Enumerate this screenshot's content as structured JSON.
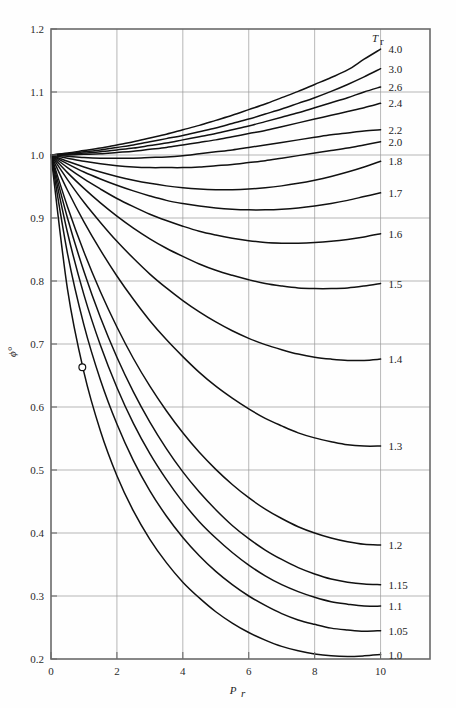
{
  "chart_data": {
    "type": "line",
    "title": "",
    "xlabel": "P_r",
    "ylabel": "ϕ°",
    "xlim": [
      0,
      11.5
    ],
    "ylim": [
      0.2,
      1.2
    ],
    "grid": true,
    "legend_position": "right-of-plot",
    "legend_title": "T_r",
    "x_ticks": [
      0,
      2,
      4,
      6,
      8,
      10
    ],
    "x_tick_labels": [
      "0",
      "2",
      "4",
      "6",
      "8",
      "10"
    ],
    "y_ticks": [
      0.2,
      0.3,
      0.4,
      0.5,
      0.6,
      0.7,
      0.8,
      0.9,
      1.0,
      1.1,
      1.2
    ],
    "y_tick_labels": [
      "0.2",
      "0.3",
      "0.4",
      "0.5",
      "0.6",
      "0.7",
      "0.8",
      "0.9",
      "1.0",
      "1.1",
      "1.2"
    ],
    "x_gridlines": [
      2,
      4,
      6,
      8,
      10
    ],
    "y_gridlines": [
      0.3,
      0.4,
      0.5,
      0.6,
      0.7,
      0.8,
      0.9,
      1.0,
      1.1
    ],
    "annotation_marker": {
      "x": 0.95,
      "y": 0.663,
      "shape": "open-circle"
    },
    "x": [
      0,
      0.5,
      1,
      1.5,
      2,
      2.5,
      3,
      3.5,
      4,
      4.5,
      5,
      5.5,
      6,
      6.5,
      7,
      7.5,
      8,
      8.5,
      9,
      9.5,
      10
    ],
    "series": [
      {
        "name": "4.0",
        "label": "4.0",
        "values": [
          1.0,
          1.003,
          1.007,
          1.011,
          1.016,
          1.021,
          1.027,
          1.033,
          1.04,
          1.047,
          1.055,
          1.063,
          1.072,
          1.081,
          1.091,
          1.101,
          1.112,
          1.123,
          1.135,
          1.152,
          1.168
        ]
      },
      {
        "name": "3.0",
        "label": "3.0",
        "values": [
          1.0,
          1.002,
          1.005,
          1.008,
          1.012,
          1.016,
          1.021,
          1.026,
          1.031,
          1.037,
          1.043,
          1.05,
          1.057,
          1.065,
          1.073,
          1.082,
          1.091,
          1.101,
          1.112,
          1.124,
          1.137
        ]
      },
      {
        "name": "2.6",
        "label": "2.6",
        "values": [
          1.0,
          1.001,
          1.003,
          1.005,
          1.008,
          1.011,
          1.015,
          1.019,
          1.024,
          1.029,
          1.034,
          1.04,
          1.046,
          1.053,
          1.06,
          1.067,
          1.075,
          1.083,
          1.091,
          1.1,
          1.108
        ]
      },
      {
        "name": "2.4",
        "label": "2.4",
        "values": [
          1.0,
          1.0,
          1.001,
          1.002,
          1.004,
          1.006,
          1.009,
          1.012,
          1.016,
          1.02,
          1.024,
          1.029,
          1.034,
          1.039,
          1.045,
          1.051,
          1.057,
          1.063,
          1.069,
          1.075,
          1.082
        ]
      },
      {
        "name": "2.2",
        "label": "2.2",
        "values": [
          1.0,
          0.998,
          0.996,
          0.995,
          0.995,
          0.995,
          0.996,
          0.997,
          0.999,
          1.002,
          1.005,
          1.008,
          1.012,
          1.016,
          1.02,
          1.024,
          1.028,
          1.032,
          1.035,
          1.038,
          1.04
        ]
      },
      {
        "name": "2.0",
        "label": "2.0",
        "values": [
          1.0,
          0.995,
          0.99,
          0.986,
          0.983,
          0.981,
          0.98,
          0.98,
          0.98,
          0.981,
          0.983,
          0.985,
          0.988,
          0.991,
          0.995,
          0.999,
          1.003,
          1.007,
          1.011,
          1.016,
          1.021
        ]
      },
      {
        "name": "1.8",
        "label": "1.8",
        "values": [
          1.0,
          0.99,
          0.981,
          0.973,
          0.966,
          0.96,
          0.955,
          0.951,
          0.948,
          0.946,
          0.945,
          0.945,
          0.946,
          0.948,
          0.951,
          0.955,
          0.96,
          0.966,
          0.973,
          0.981,
          0.99
        ]
      },
      {
        "name": "1.7",
        "label": "1.7",
        "values": [
          1.0,
          0.986,
          0.973,
          0.962,
          0.952,
          0.943,
          0.935,
          0.928,
          0.923,
          0.919,
          0.916,
          0.914,
          0.913,
          0.913,
          0.914,
          0.916,
          0.919,
          0.923,
          0.928,
          0.934,
          0.94
        ]
      },
      {
        "name": "1.6",
        "label": "1.6",
        "values": [
          1.0,
          0.98,
          0.962,
          0.946,
          0.931,
          0.918,
          0.906,
          0.896,
          0.887,
          0.879,
          0.873,
          0.868,
          0.864,
          0.861,
          0.86,
          0.86,
          0.861,
          0.863,
          0.866,
          0.87,
          0.875
        ]
      },
      {
        "name": "1.5",
        "label": "1.5",
        "values": [
          1.0,
          0.972,
          0.947,
          0.924,
          0.903,
          0.884,
          0.867,
          0.852,
          0.839,
          0.827,
          0.817,
          0.809,
          0.802,
          0.796,
          0.792,
          0.789,
          0.788,
          0.788,
          0.789,
          0.792,
          0.796
        ]
      },
      {
        "name": "1.4",
        "label": "1.4",
        "values": [
          1.0,
          0.961,
          0.925,
          0.893,
          0.863,
          0.836,
          0.811,
          0.789,
          0.769,
          0.751,
          0.735,
          0.721,
          0.709,
          0.699,
          0.691,
          0.684,
          0.679,
          0.676,
          0.674,
          0.674,
          0.676
        ]
      },
      {
        "name": "1.3",
        "label": "1.3",
        "values": [
          1.0,
          0.944,
          0.894,
          0.849,
          0.808,
          0.771,
          0.737,
          0.707,
          0.68,
          0.655,
          0.633,
          0.614,
          0.597,
          0.582,
          0.57,
          0.559,
          0.551,
          0.545,
          0.54,
          0.538,
          0.538
        ]
      },
      {
        "name": "1.2",
        "label": "1.2",
        "values": [
          1.0,
          0.918,
          0.846,
          0.783,
          0.727,
          0.677,
          0.633,
          0.594,
          0.559,
          0.528,
          0.501,
          0.477,
          0.456,
          0.438,
          0.423,
          0.41,
          0.4,
          0.392,
          0.386,
          0.382,
          0.381
        ]
      },
      {
        "name": "1.15",
        "label": "1.15",
        "values": [
          1.0,
          0.9,
          0.815,
          0.742,
          0.679,
          0.624,
          0.576,
          0.534,
          0.497,
          0.465,
          0.437,
          0.412,
          0.391,
          0.373,
          0.358,
          0.345,
          0.335,
          0.327,
          0.322,
          0.319,
          0.318
        ]
      },
      {
        "name": "1.1",
        "label": "1.1",
        "values": [
          1.0,
          0.877,
          0.778,
          0.698,
          0.631,
          0.574,
          0.526,
          0.485,
          0.449,
          0.418,
          0.392,
          0.369,
          0.349,
          0.332,
          0.318,
          0.307,
          0.298,
          0.291,
          0.287,
          0.284,
          0.284
        ]
      },
      {
        "name": "1.05",
        "label": "1.05",
        "values": [
          1.0,
          0.844,
          0.73,
          0.643,
          0.573,
          0.515,
          0.467,
          0.427,
          0.393,
          0.364,
          0.339,
          0.318,
          0.3,
          0.285,
          0.272,
          0.262,
          0.255,
          0.249,
          0.246,
          0.244,
          0.245
        ]
      },
      {
        "name": "1.0",
        "label": "1.0",
        "values": [
          1.0,
          0.787,
          0.655,
          0.562,
          0.491,
          0.435,
          0.39,
          0.353,
          0.322,
          0.297,
          0.275,
          0.257,
          0.242,
          0.23,
          0.22,
          0.213,
          0.208,
          0.205,
          0.204,
          0.205,
          0.207
        ]
      }
    ]
  },
  "axes": {
    "y_axis_title": "ϕ°",
    "x_axis_title": "P",
    "x_axis_subscript": "r",
    "legend_header": "T",
    "legend_header_subscript": "r"
  }
}
